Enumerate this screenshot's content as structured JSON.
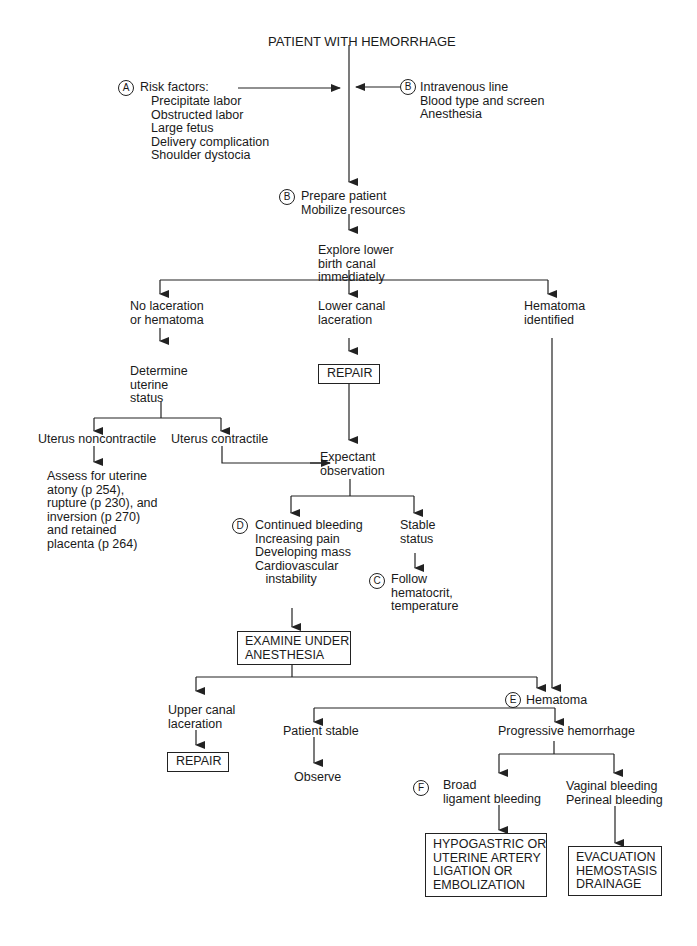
{
  "title": "PATIENT WITH HEMORRHAGE",
  "nodes": {
    "risk_factors": {
      "marker": "A",
      "heading": "Risk factors:",
      "items": "Precipitate labor\nObstructed labor\nLarge fetus\nDelivery complication\nShoulder dystocia"
    },
    "iv_line": {
      "marker": "B",
      "text": "Intravenous line\nBlood type and screen\nAnesthesia"
    },
    "prepare": {
      "marker": "B",
      "text": "Prepare patient\nMobilize resources"
    },
    "explore": {
      "text": "Explore lower\nbirth canal\nimmediately"
    },
    "no_laceration": {
      "text": "No laceration\nor hematoma"
    },
    "lower_canal": {
      "text": "Lower canal\nlaceration"
    },
    "hematoma_identified": {
      "text": "Hematoma\nidentified"
    },
    "repair1": {
      "text": "REPAIR"
    },
    "determine_uterine": {
      "text": "Determine\nuterine\nstatus"
    },
    "uterus_noncontractile": {
      "text": "Uterus noncontractile"
    },
    "uterus_contractile": {
      "text": "Uterus contractile"
    },
    "assess": {
      "text": "Assess for uterine\natony (p 254),\nrupture (p 230), and\ninversion (p 270)\nand retained\nplacenta (p 264)"
    },
    "expectant": {
      "text": "Expectant\nobservation"
    },
    "continued_bleeding": {
      "marker": "D",
      "text": "Continued bleeding\nIncreasing pain\nDeveloping mass\nCardiovascular\n   instability"
    },
    "stable_status": {
      "text": "Stable\nstatus"
    },
    "follow": {
      "marker": "C",
      "text": "Follow\nhematocrit,\ntemperature"
    },
    "examine": {
      "text": "EXAMINE UNDER\nANESTHESIA"
    },
    "upper_canal": {
      "text": "Upper canal\nlaceration"
    },
    "repair2": {
      "text": "REPAIR"
    },
    "hematoma": {
      "marker": "E",
      "text": "Hematoma"
    },
    "patient_stable": {
      "text": "Patient stable"
    },
    "observe": {
      "text": "Observe"
    },
    "progressive": {
      "text": "Progressive hemorrhage"
    },
    "broad_ligament": {
      "marker": "F",
      "text": "Broad\nligament bleeding"
    },
    "vaginal": {
      "text": "Vaginal bleeding\nPerineal bleeding"
    },
    "hypogastric": {
      "text": "HYPOGASTRIC OR\nUTERINE ARTERY\nLIGATION OR\nEMBOLIZATION"
    },
    "evacuation": {
      "text": "EVACUATION\nHEMOSTASIS\nDRAINAGE"
    }
  },
  "colors": {
    "line": "#222222",
    "text": "#1a1a1a",
    "background": "#ffffff"
  }
}
